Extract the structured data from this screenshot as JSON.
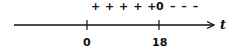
{
  "diagram": {
    "type": "sign-chart",
    "variable": "t",
    "signs": {
      "positive_region": "+ + + + +",
      "zero_marker": "0",
      "negative_region": "– – –"
    },
    "ticks": [
      {
        "value": 0,
        "label": "0"
      },
      {
        "value": 18,
        "label": "18"
      }
    ],
    "colors": {
      "line": "#111111",
      "background": "#ffffff"
    }
  }
}
